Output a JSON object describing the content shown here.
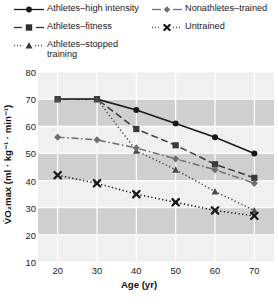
{
  "chart_data": {
    "type": "line",
    "title": "",
    "xlabel": "Age (yr)",
    "ylabel": "V̇O₂max (ml · kg⁻¹ · min⁻¹)",
    "x": [
      20,
      30,
      40,
      50,
      60,
      70
    ],
    "xtick_labels": [
      "20",
      "30",
      "40",
      "50",
      "60",
      "70"
    ],
    "ytick_labels": [
      "80",
      "70",
      "60",
      "50",
      "40",
      "30",
      "20",
      "10"
    ],
    "yticks": [
      80,
      70,
      60,
      50,
      40,
      30,
      20,
      10
    ],
    "xlim": [
      15,
      75
    ],
    "ylim": [
      10,
      80
    ],
    "grid": true,
    "legend_position": "top",
    "series": [
      {
        "name": "Athletes–high intensity",
        "marker": "circle",
        "line": "solid",
        "color": "#1a1a1a",
        "values": [
          70,
          70,
          66,
          61,
          56,
          50
        ]
      },
      {
        "name": "Athletes–fitness",
        "marker": "square",
        "line": "dashed",
        "color": "#3a3a3a",
        "values": [
          70,
          70,
          59,
          53,
          46,
          41
        ]
      },
      {
        "name": "Athletes–stopped training",
        "marker": "triangle",
        "line": "dotted",
        "color": "#4a4a4a",
        "values": [
          70,
          70,
          51,
          44,
          36,
          29
        ]
      },
      {
        "name": "Nonathletes–trained",
        "marker": "diamond",
        "line": "dashdot",
        "color": "#6f6f6f",
        "values": [
          56,
          55,
          52,
          48,
          44,
          39
        ]
      },
      {
        "name": "Untrained",
        "marker": "x",
        "line": "dotted",
        "color": "#1a1a1a",
        "values": [
          42,
          39,
          35,
          32,
          29,
          27
        ]
      }
    ]
  },
  "legend": {
    "entries": [
      {
        "label": "Athletes–high intensity",
        "label_line2": ""
      },
      {
        "label": "Nonathletes–trained",
        "label_line2": ""
      },
      {
        "label": "Athletes–fitness",
        "label_line2": ""
      },
      {
        "label": "Untrained",
        "label_line2": ""
      },
      {
        "label": "Athletes–stopped",
        "label_line2": "training"
      }
    ]
  },
  "axes": {
    "x_label": "Age (yr)",
    "y_label": "V̇O₂max (ml · kg⁻¹ · min⁻¹)"
  },
  "colors": {
    "band_light": "#f0f0f0",
    "band_dark": "#cfcfcf",
    "grid": "#ffffff",
    "text": "#1a1a1a"
  }
}
